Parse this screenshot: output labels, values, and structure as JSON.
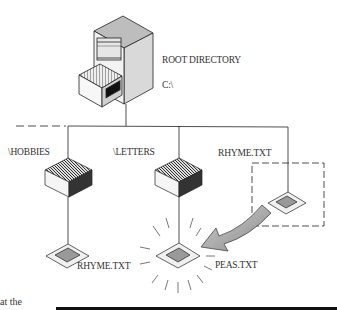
{
  "diagram": {
    "root": {
      "title": "ROOT DIRECTORY",
      "drive": "C:\\"
    },
    "directories": [
      {
        "name": "\\HOBBIES",
        "file": "RHYME.TXT"
      },
      {
        "name": "\\LETTERS",
        "file": "PEAS.TXT"
      }
    ],
    "root_file": "RHYME.TXT",
    "caption_fragment": "at the",
    "colors": {
      "line": "#1a1a1a",
      "cabinet_top": "#bdbdbd",
      "cabinet_side": "#d9d9d9",
      "arrow": "#9a9a9a"
    }
  }
}
